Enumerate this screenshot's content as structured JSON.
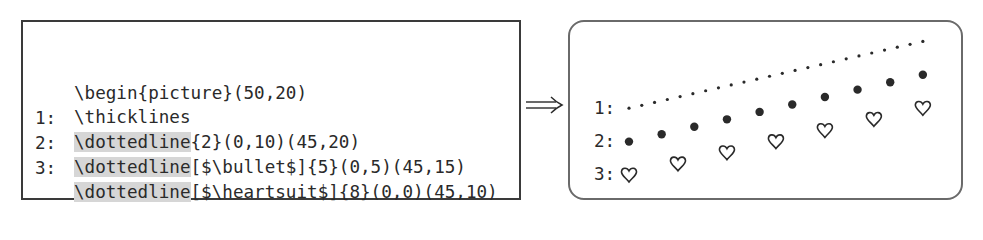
{
  "code_panel": {
    "lines": [
      {
        "num": "",
        "command": "",
        "rest": "\\begin{picture}(50,20)"
      },
      {
        "num": "",
        "command": "",
        "rest": "\\thicklines"
      },
      {
        "num": "1:",
        "command": "\\dottedline",
        "rest": "{2}(0,10)(45,20)"
      },
      {
        "num": "2:",
        "command": "\\dottedline",
        "rest": "[$\\bullet$]{5}(0,5)(45,15)"
      },
      {
        "num": "3:",
        "command": "\\dottedline",
        "rest": "[$\\heartsuit$]{8}(0,0)(45,10)"
      },
      {
        "num": "",
        "command": "",
        "rest": "\\end{picture}"
      }
    ]
  },
  "arrow": {
    "symbol": "implies-arrow",
    "glyph": "⟹"
  },
  "output_panel": {
    "labels": [
      "1:",
      "2:",
      "3:"
    ],
    "picture": {
      "width": 50,
      "height": 20
    },
    "lines": [
      {
        "id": 1,
        "marker": "dot",
        "spacing": 2,
        "from": [
          0,
          10
        ],
        "to": [
          45,
          20
        ]
      },
      {
        "id": 2,
        "marker": "bullet",
        "spacing": 5,
        "from": [
          0,
          5
        ],
        "to": [
          45,
          15
        ]
      },
      {
        "id": 3,
        "marker": "heart",
        "spacing": 8,
        "from": [
          0,
          0
        ],
        "to": [
          45,
          10
        ]
      }
    ]
  },
  "colors": {
    "text": "#2a2a2a",
    "highlight": "#d6d6d6",
    "frame": "#3a3a3a",
    "output_frame": "#6a6a6a"
  }
}
